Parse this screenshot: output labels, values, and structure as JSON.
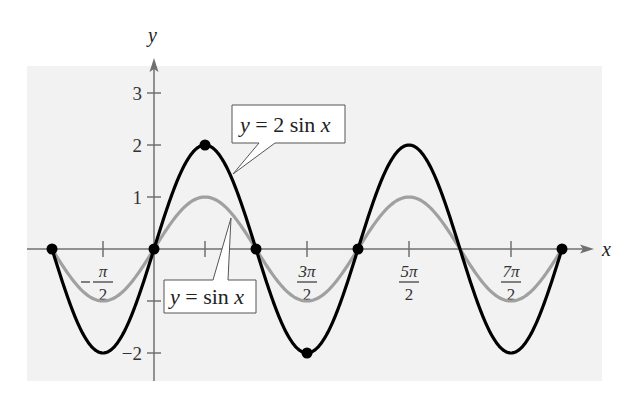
{
  "chart_data": {
    "type": "line",
    "title": "",
    "xlabel": "x",
    "ylabel": "y",
    "xlim": [
      -3.14159,
      7.2
    ],
    "ylim": [
      -2.5,
      3.5
    ],
    "grid": false,
    "x_ticks": [
      {
        "value": -1.5708,
        "num": "π",
        "den": "2",
        "neg": true
      },
      {
        "value": 1.5708,
        "num": "",
        "den": "",
        "neg": false
      },
      {
        "value": 4.7124,
        "num": "3π",
        "den": "2",
        "neg": false
      },
      {
        "value": 7.854,
        "num": "5π",
        "den": "2",
        "neg": false
      },
      {
        "value": 10.9956,
        "num": "7π",
        "den": "2",
        "neg": false
      }
    ],
    "y_ticks": [
      {
        "value": 3,
        "label": "3"
      },
      {
        "value": 2,
        "label": "2"
      },
      {
        "value": 1,
        "label": "1"
      },
      {
        "value": -1,
        "label": ""
      },
      {
        "value": -2,
        "label": "−2"
      }
    ],
    "series": [
      {
        "name": "y = 2 sin x",
        "amplitude": 2,
        "color": "#000000",
        "x_range": [
          -3.14159,
          12.56637
        ]
      },
      {
        "name": "y = sin x",
        "amplitude": 1,
        "color": "#a0a0a0",
        "x_range": [
          -3.14159,
          12.56637
        ]
      }
    ],
    "key_points": [
      {
        "x": -3.14159,
        "y": 0
      },
      {
        "x": 0,
        "y": 0
      },
      {
        "x": 1.5708,
        "y": 2
      },
      {
        "x": 3.14159,
        "y": 0
      },
      {
        "x": 4.7124,
        "y": -2
      },
      {
        "x": 6.28319,
        "y": 0
      },
      {
        "x": 12.56637,
        "y": 0
      }
    ],
    "annotations": [
      {
        "text_pre": "y",
        "text_mid": " = 2 sin ",
        "text_post": "x",
        "target_series": "y = 2 sin x"
      },
      {
        "text_pre": "y",
        "text_mid": " = sin ",
        "text_post": "x",
        "target_series": "y = sin x"
      }
    ],
    "legend": "callout labels"
  }
}
